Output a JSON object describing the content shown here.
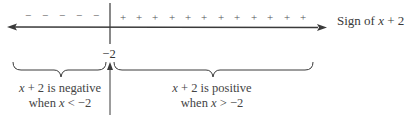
{
  "diagram": {
    "title_label": "Sign of x + 2",
    "title_parts": {
      "prefix": "Sign of ",
      "var": "x",
      "suffix": " + 2"
    },
    "critical_point": "−2",
    "negative_signs": [
      "−",
      "−",
      "−",
      "−",
      "−"
    ],
    "positive_signs": [
      "+",
      "+",
      "+",
      "+",
      "+",
      "+",
      "+",
      "+",
      "+",
      "+",
      "+",
      "+"
    ],
    "left_caption": {
      "line1": {
        "var": "x",
        "text": " + 2 is negative"
      },
      "line2": {
        "text": "when ",
        "var": "x",
        "rest": " < −2"
      }
    },
    "right_caption": {
      "line1": {
        "var": "x",
        "text": " + 2 is positive"
      },
      "line2": {
        "text": "when ",
        "var": "x",
        "rest": " > −2"
      }
    },
    "colors": {
      "line": "#3a3a3a",
      "text": "#3a3a3a"
    }
  }
}
